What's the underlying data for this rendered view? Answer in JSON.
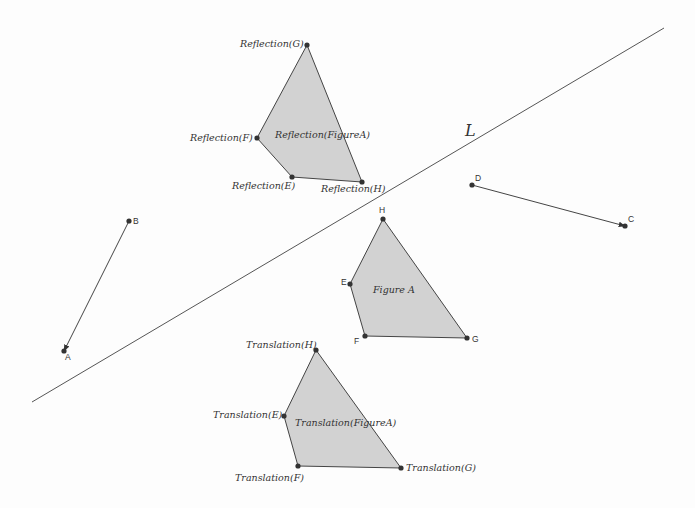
{
  "diagram": {
    "line": {
      "name": "L",
      "x1": 32,
      "y1": 402,
      "x2": 664,
      "y2": 28,
      "label_x": 465,
      "label_y": 136
    },
    "colors": {
      "background": "#fdfdfd",
      "stroke": "#444444",
      "fill": "#d2d2d2",
      "point": "#333333"
    },
    "vectors": [
      {
        "id": "BA",
        "from": {
          "label": "B",
          "x": 129,
          "y": 221,
          "lx": 133,
          "ly": 224
        },
        "to": {
          "label": "A",
          "x": 64,
          "y": 351,
          "lx": 65,
          "ly": 360
        }
      },
      {
        "id": "DC",
        "from": {
          "label": "D",
          "x": 472,
          "y": 185,
          "lx": 475,
          "ly": 181
        },
        "to": {
          "label": "C",
          "x": 625,
          "y": 226,
          "lx": 628,
          "ly": 222
        }
      }
    ],
    "figures": [
      {
        "id": "figure-a",
        "label": "Figure A",
        "label_x": 373,
        "label_y": 293,
        "label_style": "italic",
        "points": [
          {
            "name": "E",
            "x": 350,
            "y": 284,
            "lx": 341,
            "ly": 285,
            "style": "sans"
          },
          {
            "name": "F",
            "x": 365,
            "y": 336,
            "lx": 354,
            "ly": 344,
            "style": "sans"
          },
          {
            "name": "G",
            "x": 467,
            "y": 338,
            "lx": 472,
            "ly": 342,
            "style": "sans"
          },
          {
            "name": "H",
            "x": 383,
            "y": 219,
            "lx": 379,
            "ly": 213,
            "style": "sans"
          }
        ]
      },
      {
        "id": "reflection-figure-a",
        "label": "Reflection(FigureA)",
        "label_x": 275,
        "label_y": 138,
        "label_style": "italic",
        "points": [
          {
            "name": "Reflection(E)",
            "x": 292,
            "y": 177,
            "lx": 232,
            "ly": 189,
            "style": "italic"
          },
          {
            "name": "Reflection(F)",
            "x": 257,
            "y": 138,
            "lx": 190,
            "ly": 141,
            "style": "italic"
          },
          {
            "name": "Reflection(G)",
            "x": 307,
            "y": 45,
            "lx": 240,
            "ly": 47,
            "style": "italic"
          },
          {
            "name": "Reflection(H)",
            "x": 362,
            "y": 182,
            "lx": 321,
            "ly": 192,
            "style": "italic"
          }
        ]
      },
      {
        "id": "translation-figure-a",
        "label": "Translation(FigureA)",
        "label_x": 295,
        "label_y": 426,
        "label_style": "italic",
        "points": [
          {
            "name": "Translation(E)",
            "x": 284,
            "y": 416,
            "lx": 213,
            "ly": 418,
            "style": "italic"
          },
          {
            "name": "Translation(F)",
            "x": 298,
            "y": 466,
            "lx": 235,
            "ly": 481,
            "style": "italic"
          },
          {
            "name": "Translation(G)",
            "x": 401,
            "y": 468,
            "lx": 406,
            "ly": 471,
            "style": "italic"
          },
          {
            "name": "Translation(H)",
            "x": 316,
            "y": 350,
            "lx": 246,
            "ly": 348,
            "style": "italic"
          }
        ]
      }
    ]
  }
}
